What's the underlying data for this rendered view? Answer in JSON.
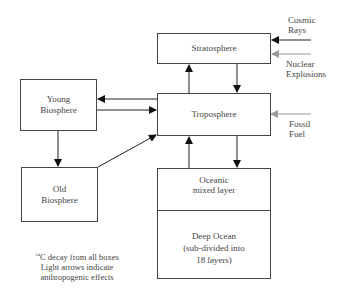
{
  "diagram": {
    "boxes": {
      "stratosphere": "Stratosphere",
      "troposphere": "Troposphere",
      "young_biosphere": "Young\nBiosphere",
      "old_biosphere": "Old\nBiosphere",
      "oceanic_mixed_layer": "Oceanic\nmixed layer",
      "deep_ocean": "Deep Ocean\n(sub-divided into\n18 layers)"
    },
    "sources": {
      "cosmic_rays": "Cosmic\nRays",
      "nuclear_explosions": "Nuclear\nExplosions",
      "fossil_fuel": "Fossil\nFuel"
    },
    "note": {
      "isotope_superscript": "14",
      "line1": "C decay from all boxes",
      "line2": "Light arrows indicate",
      "line3": "anthropogenic effects"
    },
    "colors": {
      "dark_arrow": "#111111",
      "light_arrow": "#9a9a9a",
      "box_border": "#444444"
    }
  }
}
